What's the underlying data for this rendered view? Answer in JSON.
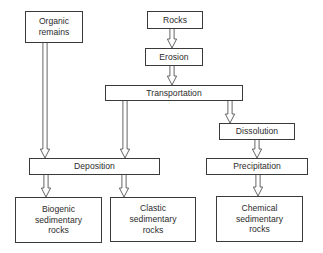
{
  "diagram": {
    "background_color": "#ffffff",
    "box_border_color": "#3a3a3a",
    "arrow_stroke_color": "#4a4a4a",
    "text_color": "#2b2b2b",
    "nodes": [
      {
        "id": "organic-remains",
        "label": "Organic\nremains",
        "x": 25,
        "y": 11,
        "w": 58,
        "h": 32
      },
      {
        "id": "rocks",
        "label": "Rocks",
        "x": 147,
        "y": 11,
        "w": 56,
        "h": 18
      },
      {
        "id": "erosion",
        "label": "Erosion",
        "x": 145,
        "y": 48,
        "w": 58,
        "h": 18
      },
      {
        "id": "transportation",
        "label": "Transportation",
        "x": 105,
        "y": 85,
        "w": 138,
        "h": 16
      },
      {
        "id": "dissolution",
        "label": "Dissolution",
        "x": 219,
        "y": 123,
        "w": 76,
        "h": 17
      },
      {
        "id": "deposition",
        "label": "Deposition",
        "x": 29,
        "y": 158,
        "w": 131,
        "h": 17
      },
      {
        "id": "precipitation",
        "label": "Precipitation",
        "x": 206,
        "y": 158,
        "w": 102,
        "h": 17
      },
      {
        "id": "biogenic-rocks",
        "label": "Biogenic\nsedimentary\nrocks",
        "x": 15,
        "y": 197,
        "w": 87,
        "h": 46
      },
      {
        "id": "clastic-rocks",
        "label": "Clastic\nsedimentary\nrocks",
        "x": 110,
        "y": 197,
        "w": 86,
        "h": 45
      },
      {
        "id": "chemical-rocks",
        "label": "Chemical\nsedimentary\nrocks",
        "x": 216,
        "y": 196,
        "w": 87,
        "h": 46
      }
    ],
    "arrows": [
      {
        "id": "organic-to-deposition",
        "from": "organic-remains",
        "to": "deposition",
        "x": 45,
        "y1": 43,
        "y2": 158
      },
      {
        "id": "rocks-to-erosion",
        "from": "rocks",
        "to": "erosion",
        "x": 172,
        "y1": 29,
        "y2": 48
      },
      {
        "id": "erosion-to-transportation",
        "from": "erosion",
        "to": "transportation",
        "x": 172,
        "y1": 66,
        "y2": 85
      },
      {
        "id": "transportation-to-deposition",
        "from": "transportation",
        "to": "deposition",
        "x": 125,
        "y1": 101,
        "y2": 158
      },
      {
        "id": "transportation-to-dissolution",
        "from": "transportation",
        "to": "dissolution",
        "x": 230,
        "y1": 101,
        "y2": 123
      },
      {
        "id": "dissolution-to-precipitation",
        "from": "dissolution",
        "to": "precipitation",
        "x": 257,
        "y1": 140,
        "y2": 158
      },
      {
        "id": "deposition-to-biogenic",
        "from": "deposition",
        "to": "biogenic-rocks",
        "x": 46,
        "y1": 175,
        "y2": 197
      },
      {
        "id": "deposition-to-clastic",
        "from": "deposition",
        "to": "clastic-rocks",
        "x": 124,
        "y1": 175,
        "y2": 197
      },
      {
        "id": "precipitation-to-chemical",
        "from": "precipitation",
        "to": "chemical-rocks",
        "x": 258,
        "y1": 175,
        "y2": 196
      }
    ]
  }
}
